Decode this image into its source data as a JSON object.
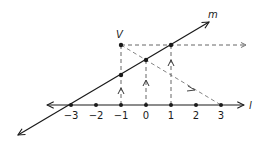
{
  "diagram": {
    "line_l": {
      "label": "l"
    },
    "line_m": {
      "label": "m"
    },
    "point_v": {
      "label": "V"
    },
    "ticks": [
      {
        "label": "−3",
        "value": -3
      },
      {
        "label": "−2",
        "value": -2
      },
      {
        "label": "−1",
        "value": -1
      },
      {
        "label": "0",
        "value": 0
      },
      {
        "label": "1",
        "value": 1
      },
      {
        "label": "2",
        "value": 2
      },
      {
        "label": "3",
        "value": 3
      }
    ],
    "colors": {
      "line": "#1a1a1a",
      "dashed": "#555555",
      "background": "#ffffff"
    }
  }
}
